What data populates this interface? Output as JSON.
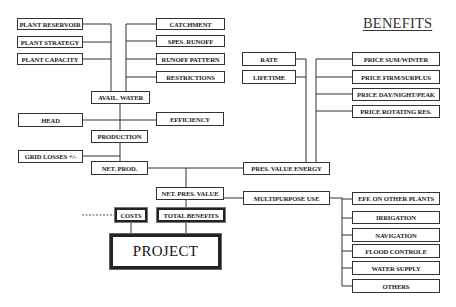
{
  "title": "BENEFITS",
  "inputs_left": [
    {
      "id": "plant-reservoir",
      "label": "PLANT RESERVOIR"
    },
    {
      "id": "plant-strategy",
      "label": "PLANT STRATEGY"
    },
    {
      "id": "plant-capacity",
      "label": "PLANT CAPACITY"
    }
  ],
  "inputs_right": [
    {
      "id": "catchment",
      "label": "CATCHMENT"
    },
    {
      "id": "spes-runoff",
      "label": "SPES. RUNOFF"
    },
    {
      "id": "runoff-pattern",
      "label": "RUNOFF PATTERN"
    },
    {
      "id": "restrictions",
      "label": "RESTRICTIONS"
    }
  ],
  "nodes": {
    "avail_water": "AVAIL. WATER",
    "head": "HEAD",
    "efficiency": "EFFICIENCY",
    "production": "PRODUCTION",
    "grid_losses": "GRID LOSSES +/-",
    "net_prod": "NET. PROD.",
    "pres_value_energy": "PRES. VALUE ENERGY",
    "rate": "RATE",
    "lifetime": "LIFETIME",
    "net_pres_value": "NET. PRES. VALUE",
    "multipurpose_use": "MULTIPURPOSE USE",
    "costs": "COSTS",
    "total_benefits": "TOTAL BENEFITS",
    "project": "PROJECT"
  },
  "prices": [
    {
      "id": "price-sum-winter",
      "label": "PRICE SUM/WINTER"
    },
    {
      "id": "price-firm-surplus",
      "label": "PRICE FIRM/SURPLUS"
    },
    {
      "id": "price-day-night-peak",
      "label": "PRICE DAY/NIGHT/PEAK"
    },
    {
      "id": "price-rotating-res",
      "label": "PRICE ROTATING RES."
    }
  ],
  "multipurpose": [
    {
      "id": "eff-on-other-plants",
      "label": "EFF. ON OTHER PLANTS"
    },
    {
      "id": "irrigation",
      "label": "IRRIGATION"
    },
    {
      "id": "navigation",
      "label": "NAVIGATION"
    },
    {
      "id": "flood-controle",
      "label": "FLOOD CONTROLE"
    },
    {
      "id": "water-supply",
      "label": "WATER SUPPLY"
    },
    {
      "id": "others",
      "label": "OTHERS"
    }
  ]
}
